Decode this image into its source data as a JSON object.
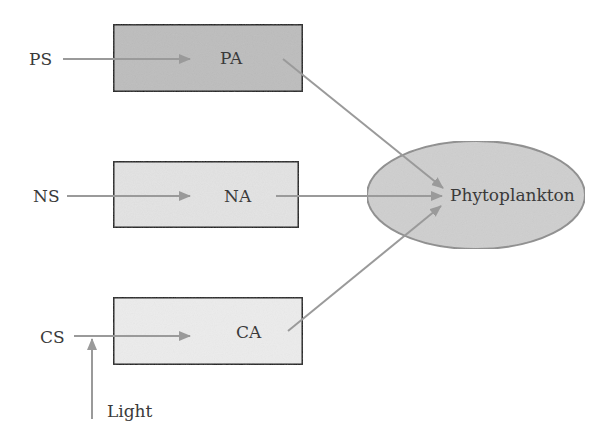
{
  "diagram": {
    "sources": [
      {
        "id": "ps",
        "label": "PS"
      },
      {
        "id": "ns",
        "label": "NS"
      },
      {
        "id": "cs",
        "label": "CS"
      }
    ],
    "boxes": [
      {
        "id": "pa",
        "label": "PA",
        "fill": "#bdbdbd"
      },
      {
        "id": "na",
        "label": "NA",
        "fill": "#e3e3e3"
      },
      {
        "id": "ca",
        "label": "CA",
        "fill": "#ececec"
      }
    ],
    "target": {
      "label": "Phytoplankton",
      "fill": "#cfcfcf",
      "stroke": "#8e8e8e"
    },
    "external_input": {
      "label": "Light"
    },
    "colors": {
      "arrow": "#9a9a9a",
      "box_border": "#1e1e1e",
      "text": "#3a3a3a"
    }
  }
}
